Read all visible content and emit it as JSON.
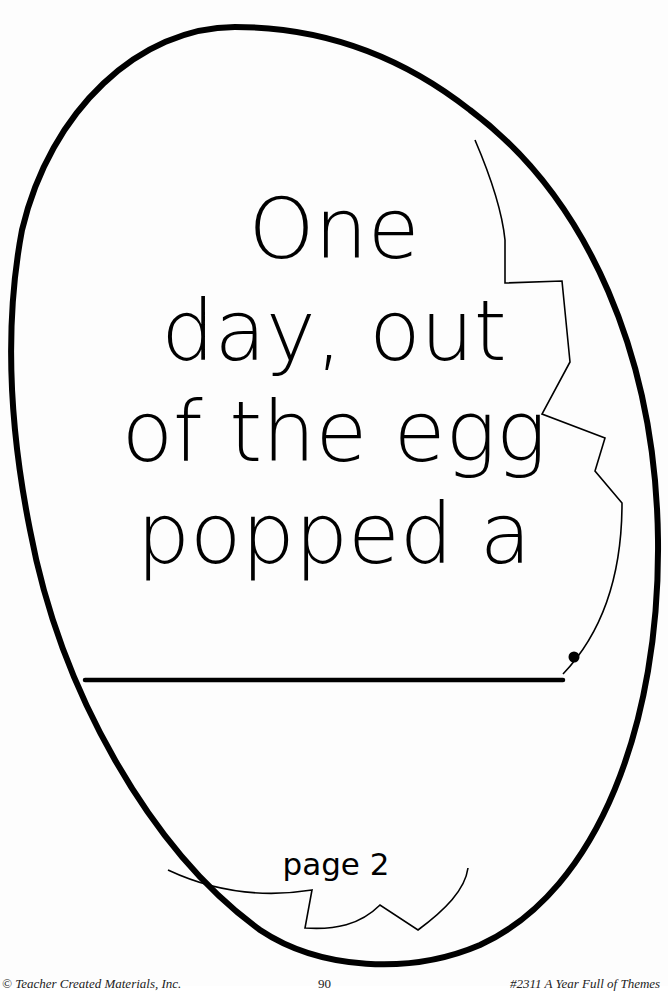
{
  "worksheet": {
    "shape": "cracked-egg-outline",
    "story_lines": [
      "One",
      "day, out",
      "of the egg",
      "popped a"
    ],
    "answer_blank": {
      "value": "",
      "terminal_punctuation": "."
    },
    "page_label": "page 2"
  },
  "footer": {
    "copyright": "© Teacher Created Materials, Inc.",
    "page_number": "90",
    "book_title": "#2311 A Year Full of Themes"
  },
  "colors": {
    "ink": "#000000",
    "paper": "#fdfdfd"
  }
}
